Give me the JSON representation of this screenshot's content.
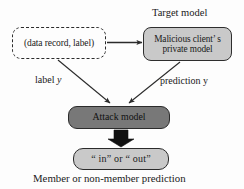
{
  "diagram": {
    "type": "flow-diagram",
    "title_caption": "Member or non-member prediction",
    "background_color": "#fdfdfd",
    "nodes": {
      "data_record": {
        "label": "(data record, label)",
        "style": "dashed",
        "fill": "#fdfdfd"
      },
      "target_model": {
        "label_line1": "Malicious client’  s",
        "label_line2": "private model",
        "group_label": "Target model",
        "style": "solid",
        "fill": "#c9c9c9"
      },
      "attack_model": {
        "label": "Attack model",
        "style": "solid",
        "fill": "#787878"
      },
      "output": {
        "label": "“ in” or “ out”",
        "style": "solid",
        "fill": "#c9c9c9"
      }
    },
    "edges": {
      "data_to_target": {
        "label": "",
        "style": "thin-arrow"
      },
      "data_to_attack": {
        "label_text": "label",
        "label_var": "y",
        "style": "thin-arrow"
      },
      "target_to_attack": {
        "label_text": "prediction",
        "label_var": "y",
        "style": "thin-arrow"
      },
      "attack_to_output": {
        "label": "",
        "style": "block-arrow"
      }
    },
    "stroke_color": "#2b2b2b"
  }
}
